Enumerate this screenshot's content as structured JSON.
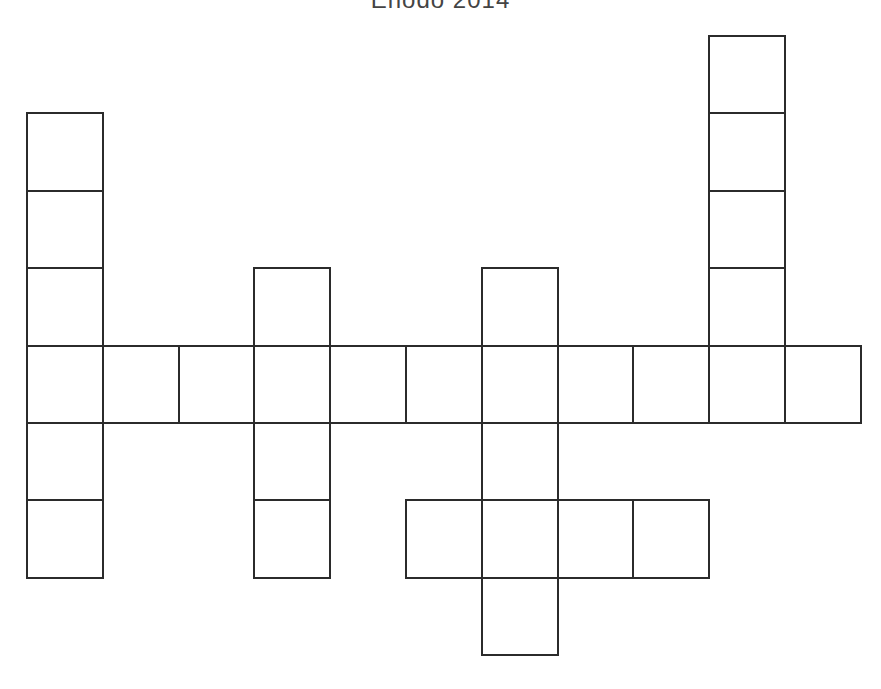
{
  "puzzle": {
    "title": "Enodo 2014",
    "grid": {
      "cols": 11,
      "rows": 8,
      "origin_x": 27,
      "origin_y": 36,
      "cell_w": 75.8,
      "cell_h": 77.4,
      "line_color": "#2b2b2b",
      "cells": [
        [
          9,
          0
        ],
        [
          0,
          1
        ],
        [
          9,
          1
        ],
        [
          0,
          2
        ],
        [
          9,
          2
        ],
        [
          0,
          3
        ],
        [
          3,
          3
        ],
        [
          6,
          3
        ],
        [
          9,
          3
        ],
        [
          0,
          4
        ],
        [
          1,
          4
        ],
        [
          2,
          4
        ],
        [
          3,
          4
        ],
        [
          4,
          4
        ],
        [
          5,
          4
        ],
        [
          6,
          4
        ],
        [
          7,
          4
        ],
        [
          8,
          4
        ],
        [
          9,
          4
        ],
        [
          10,
          4
        ],
        [
          0,
          5
        ],
        [
          3,
          5
        ],
        [
          6,
          5
        ],
        [
          0,
          6
        ],
        [
          3,
          6
        ],
        [
          5,
          6
        ],
        [
          6,
          6
        ],
        [
          7,
          6
        ],
        [
          8,
          6
        ],
        [
          6,
          7
        ]
      ]
    }
  }
}
